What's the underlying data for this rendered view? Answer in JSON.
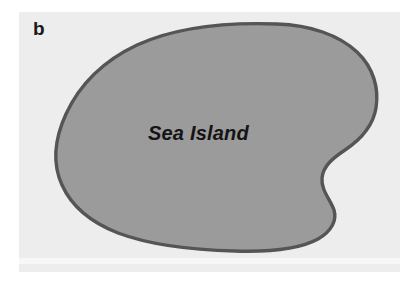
{
  "figure": {
    "panel_label": "b",
    "caption_text": "",
    "background_color": "#ffffff",
    "plate_color": "#ededed",
    "plate_band_color": "#f7f7f7"
  },
  "map": {
    "type": "schematic-island-map",
    "landmass": {
      "name": "Sea Island",
      "fill_color": "#9b9b9b",
      "outline_color": "#555555",
      "outline_width_px": 3.4
    },
    "labels": [
      {
        "text": "Sea Island",
        "style": "bold-italic",
        "color": "#141414",
        "x": 148,
        "y": 123
      }
    ]
  }
}
